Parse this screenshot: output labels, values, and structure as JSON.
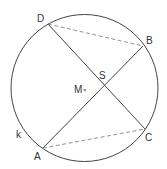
{
  "diagram": {
    "circle": {
      "label": "k",
      "cx": 84.5,
      "cy": 88,
      "r": 73.5
    },
    "center": {
      "label": "M",
      "marker": "×",
      "x": 85,
      "y": 89
    },
    "intersection": {
      "label": "S",
      "x": 103,
      "y": 86
    },
    "points": {
      "A": {
        "label": "A",
        "x": 43,
        "y": 148
      },
      "B": {
        "label": "B",
        "x": 143,
        "y": 46
      },
      "C": {
        "label": "C",
        "x": 145,
        "y": 129
      },
      "D": {
        "label": "D",
        "x": 48,
        "y": 24
      }
    },
    "solid_segments": [
      "AB",
      "DC"
    ],
    "dashed_segments": [
      "DB",
      "AC"
    ],
    "colors": {
      "stroke": "#444444",
      "dashed": "#777777",
      "text": "#333333"
    }
  }
}
